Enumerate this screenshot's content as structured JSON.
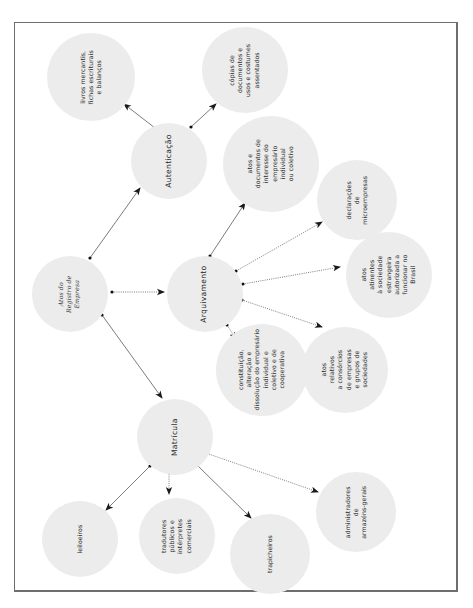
{
  "diagram": {
    "title": "Atos do Registro de Empresa",
    "colors": {
      "node_fill": "#ececec",
      "text": "#2a2a2a",
      "frame": "#6e6e6e",
      "edge": "#333333"
    },
    "nodes": {
      "root": {
        "label": "Atos do\nRegistro de\nEmpresa"
      },
      "autenticacao": {
        "label": "Autenticação"
      },
      "arquivamento": {
        "label": "Arquivamento"
      },
      "matricula": {
        "label": "Matrícula"
      },
      "livros": {
        "label": "livros mercantis,\nfichas escriturais\ne balanços"
      },
      "copias": {
        "label": "cópias de\ndocumentos e\nusos e costumes\nassentados"
      },
      "atos_documentos": {
        "label": "atos e\ndocumentos de\ninteresse do\nempresário\nindividual\nou coletivo"
      },
      "declaracoes": {
        "label": "declarações\nde\nmicroempresas"
      },
      "atos_atinentes": {
        "label": "atos\natinentes\nà sociedade\nestrangeira\nautorizada a\nfuncionar no\nBrasil"
      },
      "atos_relativos": {
        "label": "atos\nrelativos\na consórcios\nde empresas\ne grupos de\nsociedades"
      },
      "constituicao": {
        "label": "constituição,\nalteração e\ndissolução do empresário\nindividual e\ncoletivo e de\ncooperativa"
      },
      "leiloeiros": {
        "label": "leiloeiros"
      },
      "tradutores": {
        "label": "tradutores\npúblicos e\nintérpretes\ncomerciais"
      },
      "trapicheiros": {
        "label": "trapicheiros"
      },
      "administradores": {
        "label": "administradores\nde\narmazéns-gerais"
      }
    },
    "edges": [
      {
        "from": "root",
        "to": "autenticacao",
        "style": "solid"
      },
      {
        "from": "root",
        "to": "arquivamento",
        "style": "dotted"
      },
      {
        "from": "root",
        "to": "matricula",
        "style": "solid"
      },
      {
        "from": "autenticacao",
        "to": "livros",
        "style": "solid"
      },
      {
        "from": "autenticacao",
        "to": "copias",
        "style": "solid"
      },
      {
        "from": "arquivamento",
        "to": "atos_documentos",
        "style": "solid"
      },
      {
        "from": "arquivamento",
        "to": "declaracoes",
        "style": "dotted"
      },
      {
        "from": "arquivamento",
        "to": "atos_atinentes",
        "style": "dotted"
      },
      {
        "from": "arquivamento",
        "to": "atos_relativos",
        "style": "dotted"
      },
      {
        "from": "arquivamento",
        "to": "constituicao",
        "style": "dotted"
      },
      {
        "from": "matricula",
        "to": "leiloeiros",
        "style": "solid"
      },
      {
        "from": "matricula",
        "to": "tradutores",
        "style": "dotted"
      },
      {
        "from": "matricula",
        "to": "trapicheiros",
        "style": "solid"
      },
      {
        "from": "matricula",
        "to": "administradores",
        "style": "dotted"
      }
    ]
  }
}
